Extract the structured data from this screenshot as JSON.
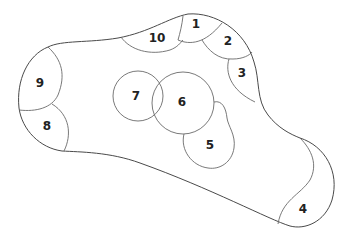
{
  "diagram": {
    "colors": {
      "stroke": "#4a4a4a",
      "text": "#222222",
      "background": "#ffffff"
    },
    "labels": [
      {
        "id": "1",
        "text": "1",
        "x": 196,
        "y": 24
      },
      {
        "id": "2",
        "text": "2",
        "x": 228,
        "y": 41
      },
      {
        "id": "3",
        "text": "3",
        "x": 242,
        "y": 73
      },
      {
        "id": "4",
        "text": "4",
        "x": 303,
        "y": 209
      },
      {
        "id": "5",
        "text": "5",
        "x": 210,
        "y": 145
      },
      {
        "id": "6",
        "text": "6",
        "x": 182,
        "y": 102
      },
      {
        "id": "7",
        "text": "7",
        "x": 136,
        "y": 96
      },
      {
        "id": "8",
        "text": "8",
        "x": 47,
        "y": 126
      },
      {
        "id": "9",
        "text": "9",
        "x": 40,
        "y": 83
      },
      {
        "id": "10",
        "text": "10",
        "x": 157,
        "y": 38
      }
    ]
  }
}
